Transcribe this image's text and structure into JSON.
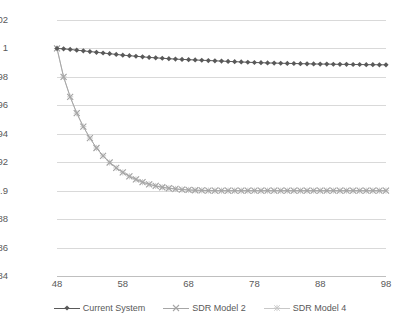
{
  "chart_data": {
    "type": "line",
    "title": "",
    "xlabel": "",
    "ylabel": "",
    "xlim": [
      48,
      98
    ],
    "ylim": [
      0.84,
      1.02
    ],
    "xticks": [
      "48",
      "58",
      "68",
      "78",
      "88",
      "98"
    ],
    "yticks": [
      "1.02",
      "1",
      "0.98",
      "0.96",
      "0.94",
      "0.92",
      "0.9",
      "0.88",
      "0.86",
      "0.84"
    ],
    "grid": true,
    "legend_position": "bottom",
    "x": [
      48,
      49,
      50,
      51,
      52,
      53,
      54,
      55,
      56,
      57,
      58,
      59,
      60,
      61,
      62,
      63,
      64,
      65,
      66,
      67,
      68,
      69,
      70,
      71,
      72,
      73,
      74,
      75,
      76,
      77,
      78,
      79,
      80,
      81,
      82,
      83,
      84,
      85,
      86,
      87,
      88,
      89,
      90,
      91,
      92,
      93,
      94,
      95,
      96,
      97,
      98
    ],
    "series": [
      {
        "name": "Current System",
        "marker": "diamond",
        "color": "#595959",
        "values": [
          1.0,
          0.9997,
          0.9993,
          0.9988,
          0.9983,
          0.9978,
          0.9973,
          0.9968,
          0.9963,
          0.9958,
          0.9953,
          0.9949,
          0.9945,
          0.9941,
          0.9937,
          0.9934,
          0.9931,
          0.9928,
          0.9925,
          0.9923,
          0.9921,
          0.9919,
          0.9917,
          0.9915,
          0.9913,
          0.9911,
          0.9909,
          0.9907,
          0.9905,
          0.9903,
          0.9901,
          0.99,
          0.9898,
          0.9897,
          0.9896,
          0.9895,
          0.9894,
          0.9893,
          0.9892,
          0.9891,
          0.989,
          0.989,
          0.9889,
          0.9888,
          0.9888,
          0.9887,
          0.9887,
          0.9886,
          0.9886,
          0.9885,
          0.9885
        ]
      },
      {
        "name": "SDR Model 2",
        "marker": "x",
        "color": "#a6a6a6",
        "values": [
          1.0,
          0.98,
          0.966,
          0.9545,
          0.945,
          0.937,
          0.93,
          0.9245,
          0.9198,
          0.916,
          0.9128,
          0.9101,
          0.9079,
          0.906,
          0.9045,
          0.9033,
          0.9024,
          0.9017,
          0.9012,
          0.9008,
          0.9005,
          0.9003,
          0.9002,
          0.9001,
          0.9,
          0.9,
          0.9,
          0.9,
          0.9,
          0.9,
          0.9,
          0.9,
          0.9,
          0.9,
          0.9,
          0.9,
          0.9,
          0.9,
          0.9,
          0.9,
          0.9,
          0.9,
          0.9,
          0.9,
          0.9,
          0.9,
          0.9,
          0.9,
          0.9,
          0.9,
          0.9
        ]
      },
      {
        "name": "SDR Model 4",
        "marker": "asterisk",
        "color": "#c8c8c8",
        "values": [
          1.0,
          0.98,
          0.966,
          0.9545,
          0.945,
          0.937,
          0.93,
          0.9245,
          0.9198,
          0.916,
          0.9128,
          0.9101,
          0.9079,
          0.906,
          0.9045,
          0.9033,
          0.9024,
          0.9017,
          0.9012,
          0.9008,
          0.9005,
          0.9003,
          0.9002,
          0.9001,
          0.9,
          0.9,
          0.9,
          0.9,
          0.9,
          0.9,
          0.9,
          0.9,
          0.9,
          0.9,
          0.9,
          0.9,
          0.9,
          0.9,
          0.9,
          0.9,
          0.9,
          0.9,
          0.9,
          0.9,
          0.9,
          0.9,
          0.9,
          0.9,
          0.9,
          0.9,
          0.9
        ]
      }
    ]
  },
  "legend": {
    "items": [
      {
        "label": "Current System"
      },
      {
        "label": "SDR Model 2"
      },
      {
        "label": "SDR Model 4"
      }
    ]
  },
  "colors": {
    "grid": "#d9d9d9",
    "axis": "#bfbfbf",
    "text": "#595959",
    "series1": "#595959",
    "series2": "#a6a6a6",
    "series3": "#c8c8c8"
  }
}
